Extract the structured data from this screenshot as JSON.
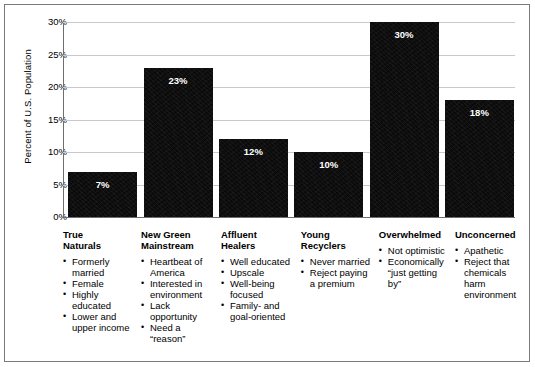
{
  "chart_data": {
    "type": "bar",
    "title": "",
    "xlabel": "",
    "ylabel": "Percent of U.S. Population",
    "ylim": [
      0,
      30
    ],
    "ytick_labels": [
      "30%",
      "25%",
      "20%",
      "15%",
      "10%",
      "5%",
      "0%"
    ],
    "yticks": [
      30,
      25,
      20,
      15,
      10,
      5,
      0
    ],
    "grid": true,
    "legend": "none",
    "categories": [
      "True Naturals",
      "New Green Mainstream",
      "Affluent Healers",
      "Young Recyclers",
      "Overwhelmed",
      "Unconcerned"
    ],
    "values": [
      7,
      23,
      12,
      10,
      30,
      18
    ],
    "data_labels": [
      "7%",
      "23%",
      "12%",
      "10%",
      "30%",
      "18%"
    ],
    "bar_color": "#0b0b0b",
    "data_label_color": "#ffffff",
    "gridline_color": "#c9c9c9",
    "axis_color": "#6e6e6e"
  },
  "segments": [
    {
      "title": "True\nNaturals",
      "value_label": "7%",
      "bullets": [
        "Formerly married",
        "Female",
        "Highly educated",
        "Lower and upper income"
      ]
    },
    {
      "title": "New Green\nMainstream",
      "value_label": "23%",
      "bullets": [
        "Heartbeat of America",
        "Interested in environment",
        "Lack opportunity",
        "Need a “reason”"
      ]
    },
    {
      "title": "Affluent\nHealers",
      "value_label": "12%",
      "bullets": [
        "Well educated",
        "Upscale",
        "Well-being focused",
        "Family- and goal-oriented"
      ]
    },
    {
      "title": "Young\nRecyclers",
      "value_label": "10%",
      "bullets": [
        "Never married",
        "Reject paying a premium"
      ]
    },
    {
      "title": "Overwhelmed",
      "value_label": "30%",
      "bullets": [
        "Not optimistic",
        "Economically “just getting by”"
      ]
    },
    {
      "title": "Unconcerned",
      "value_label": "18%",
      "bullets": [
        "Apathetic",
        "Reject that chemicals harm environment"
      ]
    }
  ]
}
